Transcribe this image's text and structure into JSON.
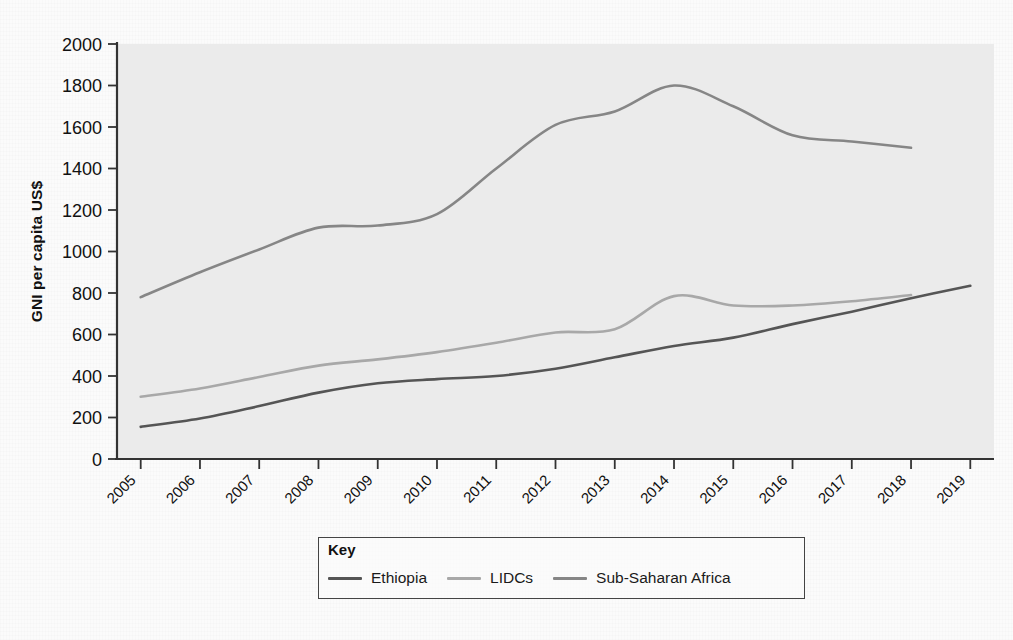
{
  "figure": {
    "background_color": "#fbfbfb",
    "plot_background_color": "#ebebeb",
    "axis_color": "#333333"
  },
  "legend": {
    "title": "Key",
    "position": "below-axis",
    "items": [
      {
        "label": "Ethiopia",
        "color": "#555555"
      },
      {
        "label": "LIDCs",
        "color": "#a8a8a8"
      },
      {
        "label": "Sub-Saharan Africa",
        "color": "#868686"
      }
    ]
  },
  "chart_data": {
    "type": "line",
    "title": "",
    "xlabel": "",
    "ylabel": "GNI per capita US$",
    "xlim": [
      2004.6,
      2019.4
    ],
    "ylim": [
      0,
      2000
    ],
    "grid": false,
    "legend_position": "bottom",
    "x": [
      2005,
      2006,
      2007,
      2008,
      2009,
      2010,
      2011,
      2012,
      2013,
      2014,
      2015,
      2016,
      2017,
      2018,
      2019
    ],
    "categories": [
      "2005",
      "2006",
      "2007",
      "2008",
      "2009",
      "2010",
      "2011",
      "2012",
      "2013",
      "2014",
      "2015",
      "2016",
      "2017",
      "2018",
      "2019"
    ],
    "ytick_labels": [
      "0",
      "200",
      "400",
      "600",
      "800",
      "1000",
      "1200",
      "1400",
      "1600",
      "1800",
      "2000"
    ],
    "ytick_values": [
      0,
      200,
      400,
      600,
      800,
      1000,
      1200,
      1400,
      1600,
      1800,
      2000
    ],
    "series": [
      {
        "name": "Ethiopia",
        "color": "#555555",
        "values": [
          155,
          185,
          230,
          290,
          330,
          370,
          385,
          400,
          430,
          490,
          545,
          590,
          660,
          720,
          770,
          835
        ],
        "x_values": [
          2005,
          2005.5,
          2006,
          2006.7,
          2007.3,
          2008,
          2008.7,
          2009.4,
          2010.2,
          2011,
          2011.8,
          2012.4,
          2013.2,
          2014,
          2015,
          2016.6
        ],
        "points": [
          {
            "year": 2005,
            "value": 155
          },
          {
            "year": 2006,
            "value": 195
          },
          {
            "year": 2007,
            "value": 255
          },
          {
            "year": 2008,
            "value": 320
          },
          {
            "year": 2009,
            "value": 365
          },
          {
            "year": 2010,
            "value": 385
          },
          {
            "year": 2011,
            "value": 400
          },
          {
            "year": 2012,
            "value": 435
          },
          {
            "year": 2013,
            "value": 490
          },
          {
            "year": 2014,
            "value": 545
          },
          {
            "year": 2015,
            "value": 585
          },
          {
            "year": 2016,
            "value": 650
          },
          {
            "year": 2017,
            "value": 710
          },
          {
            "year": 2018,
            "value": 775
          },
          {
            "year": 2019,
            "value": 835
          }
        ]
      },
      {
        "name": "LIDCs",
        "color": "#a8a8a8",
        "points": [
          {
            "year": 2005,
            "value": 300
          },
          {
            "year": 2006,
            "value": 340
          },
          {
            "year": 2007,
            "value": 395
          },
          {
            "year": 2008,
            "value": 450
          },
          {
            "year": 2009,
            "value": 480
          },
          {
            "year": 2010,
            "value": 515
          },
          {
            "year": 2011,
            "value": 560
          },
          {
            "year": 2012,
            "value": 610
          },
          {
            "year": 2013,
            "value": 625
          },
          {
            "year": 2014,
            "value": 785
          },
          {
            "year": 2015,
            "value": 740
          },
          {
            "year": 2016,
            "value": 740
          },
          {
            "year": 2017,
            "value": 760
          },
          {
            "year": 2018,
            "value": 790
          }
        ]
      },
      {
        "name": "Sub-Saharan Africa",
        "color": "#868686",
        "points": [
          {
            "year": 2005,
            "value": 780
          },
          {
            "year": 2006,
            "value": 900
          },
          {
            "year": 2007,
            "value": 1010
          },
          {
            "year": 2008,
            "value": 1115
          },
          {
            "year": 2009,
            "value": 1125
          },
          {
            "year": 2010,
            "value": 1180
          },
          {
            "year": 2011,
            "value": 1400
          },
          {
            "year": 2012,
            "value": 1610
          },
          {
            "year": 2013,
            "value": 1675
          },
          {
            "year": 2014,
            "value": 1800
          },
          {
            "year": 2015,
            "value": 1700
          },
          {
            "year": 2016,
            "value": 1560
          },
          {
            "year": 2017,
            "value": 1530
          },
          {
            "year": 2018,
            "value": 1500
          }
        ]
      }
    ]
  }
}
